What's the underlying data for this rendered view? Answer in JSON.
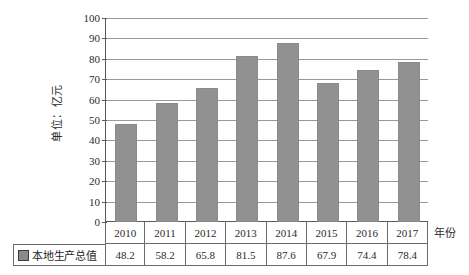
{
  "chart_data": {
    "type": "bar",
    "title": "",
    "subtitle": "",
    "xlabel": "年份",
    "ylabel": "单位：亿元",
    "categories": [
      "2010",
      "2011",
      "2012",
      "2013",
      "2014",
      "2015",
      "2016",
      "2017"
    ],
    "values": [
      48.2,
      58.2,
      65.8,
      81.5,
      87.6,
      67.9,
      74.4,
      78.4
    ],
    "series": [
      {
        "name": "本地生产总值",
        "values": [
          48.2,
          58.2,
          65.8,
          81.5,
          87.6,
          67.9,
          74.4,
          78.4
        ]
      }
    ],
    "ylim": [
      0,
      100
    ],
    "y_ticks": [
      100,
      90,
      80,
      70,
      60,
      50,
      40,
      30,
      20,
      10,
      0
    ],
    "y_tick_labels": [
      "100",
      "90",
      "80",
      "70",
      "60",
      "50",
      "40",
      "30",
      "20",
      "10",
      "0"
    ],
    "value_labels": [
      "48.2",
      "58.2",
      "65.8",
      "81.5",
      "87.6",
      "67.9",
      "74.4",
      "78.4"
    ],
    "grid": true,
    "legend_position": "bottom-left",
    "bar_color": "#919191",
    "gridline_color": "#9a9a9a",
    "axis_color": "#5a5a5a"
  },
  "legend": {
    "swatch_icon": "square-marker-icon",
    "label": "本地生产总值"
  },
  "table": {
    "year_row": [
      "2010",
      "2011",
      "2012",
      "2013",
      "2014",
      "2015",
      "2016",
      "2017"
    ],
    "value_row": [
      "48.2",
      "58.2",
      "65.8",
      "81.5",
      "87.6",
      "67.9",
      "74.4",
      "78.4"
    ]
  },
  "axis_titles": {
    "y": "单位：亿元",
    "x": "年份"
  }
}
